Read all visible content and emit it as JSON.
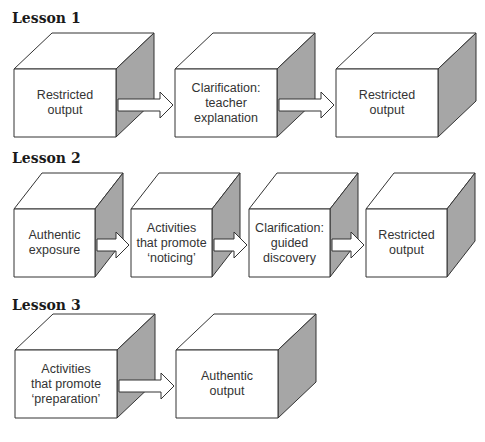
{
  "lessons": [
    {
      "title": "Lesson 1",
      "steps": [
        "Restricted\noutput",
        "Clarification:\nteacher\nexplanation",
        "Restricted\noutput"
      ]
    },
    {
      "title": "Lesson 2",
      "steps": [
        "Authentic\nexposure",
        "Activities\nthat promote\n‘noticing’",
        "Clarification:\nguided\ndiscovery",
        "Restricted\noutput"
      ]
    },
    {
      "title": "Lesson 3",
      "steps": [
        "Activities\nthat promote\n‘preparation’",
        "Authentic\noutput"
      ]
    }
  ],
  "colors": {
    "side_face": "#a6a6a6",
    "stroke": "#333333",
    "face": "#ffffff"
  }
}
